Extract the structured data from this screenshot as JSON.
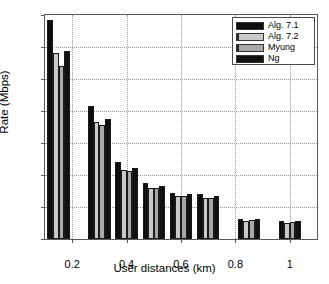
{
  "chart_data": {
    "type": "bar",
    "title": "",
    "xlabel": "User distances (km)",
    "ylabel": "Rate (Mbps)",
    "categories": [
      "0.15",
      "0.3",
      "0.4",
      "0.5",
      "0.6",
      "0.7",
      "0.85",
      "1"
    ],
    "xtick_labels": [
      "0.2",
      "0.4",
      "0.6",
      "0.8",
      "1"
    ],
    "xtick_values": [
      0.2,
      0.4,
      0.6,
      0.8,
      1
    ],
    "ytick_labels": [
      "0",
      "1",
      "2",
      "3",
      "4",
      "5",
      "6",
      "7"
    ],
    "ytick_values": [
      0,
      1,
      2,
      3,
      4,
      5,
      6,
      7
    ],
    "ylim": [
      0,
      7
    ],
    "xlim": [
      0.1,
      1.1
    ],
    "grid": true,
    "legend_position": "top-right",
    "series": [
      {
        "name": "Alg. 7.1",
        "color": "#0d0d0d",
        "values": [
          6.85,
          4.15,
          2.4,
          1.75,
          1.45,
          1.42,
          0.62,
          0.56
        ]
      },
      {
        "name": "Alg. 7.2",
        "color": "#c9c9c9",
        "values": [
          5.81,
          3.66,
          2.15,
          1.6,
          1.33,
          1.27,
          0.57,
          0.51
        ]
      },
      {
        "name": "Myung",
        "color": "#a8a8a8",
        "values": [
          5.41,
          3.55,
          2.12,
          1.58,
          1.35,
          1.28,
          0.58,
          0.52
        ]
      },
      {
        "name": "Ng",
        "color": "#111111",
        "values": [
          5.86,
          3.76,
          2.22,
          1.67,
          1.4,
          1.33,
          0.61,
          0.56
        ]
      }
    ]
  }
}
